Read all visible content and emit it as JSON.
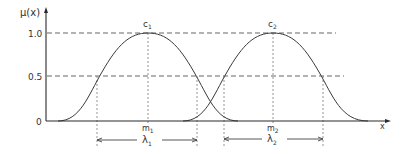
{
  "figure": {
    "type": "gaussian-membership-functions",
    "y_axis_label": "μ(x)",
    "x_axis_label": "x",
    "y_ticks": [
      {
        "label": "1.0",
        "value": 1.0
      },
      {
        "label": "0.5",
        "value": 0.5
      },
      {
        "label": "0",
        "value": 0
      }
    ],
    "curves": [
      {
        "name": "membership-1",
        "peak_label": "c",
        "peak_sub": "1",
        "center_label": "m",
        "center_sub": "1",
        "width_label": "λ",
        "width_sub": "1"
      },
      {
        "name": "membership-2",
        "peak_label": "c",
        "peak_sub": "2",
        "center_label": "m",
        "center_sub": "2",
        "width_label": "λ",
        "width_sub": "2"
      }
    ],
    "colors": {
      "background": "#ffffff",
      "ink": "#333333"
    }
  }
}
